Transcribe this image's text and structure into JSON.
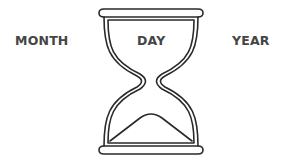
{
  "labels": {
    "month": "MONTH",
    "day": "DAY",
    "year": "YEAR"
  },
  "icon": "hourglass-icon",
  "colors": {
    "stroke": "#2a2a2a",
    "text": "#454545",
    "background": "#ffffff"
  }
}
